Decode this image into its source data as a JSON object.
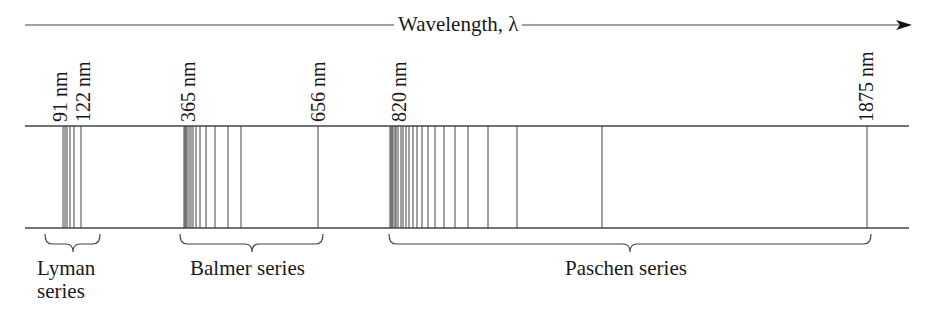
{
  "diagram": {
    "title": "Wavelength, λ",
    "colors": {
      "line": "#444444",
      "text": "#1a1a1a",
      "background": "#ffffff"
    },
    "wavelength_labels": [
      {
        "text": "91 nm",
        "x": 60
      },
      {
        "text": "122 nm",
        "x": 83
      },
      {
        "text": "365 nm",
        "x": 188
      },
      {
        "text": "656 nm",
        "x": 318
      },
      {
        "text": "820 nm",
        "x": 399
      },
      {
        "text": "1875 nm",
        "x": 866
      }
    ],
    "series": [
      {
        "name": "Lyman series",
        "label_lines": [
          "Lyman",
          "series"
        ],
        "range_nm": [
          91,
          122
        ],
        "lines_x": [
          63,
          65,
          67,
          70,
          74,
          81
        ],
        "brace": {
          "x1": 45,
          "x2": 100,
          "tip": 73
        }
      },
      {
        "name": "Balmer series",
        "label_lines": [
          "Balmer series"
        ],
        "range_nm": [
          365,
          656
        ],
        "lines_x": [
          184,
          185,
          186,
          187,
          189,
          191,
          193,
          196,
          200,
          206,
          215,
          228,
          241,
          318
        ],
        "brace": {
          "x1": 180,
          "x2": 323,
          "tip": 252
        }
      },
      {
        "name": "Paschen series",
        "label_lines": [
          "Paschen series"
        ],
        "range_nm": [
          820,
          1875
        ],
        "lines_x": [
          390,
          391,
          392,
          393,
          395,
          396,
          398,
          401,
          403,
          406,
          409,
          413,
          417,
          422,
          428,
          435,
          444,
          455,
          468,
          488,
          517,
          602,
          867
        ],
        "brace": {
          "x1": 389,
          "x2": 871,
          "tip": 630
        }
      }
    ]
  }
}
